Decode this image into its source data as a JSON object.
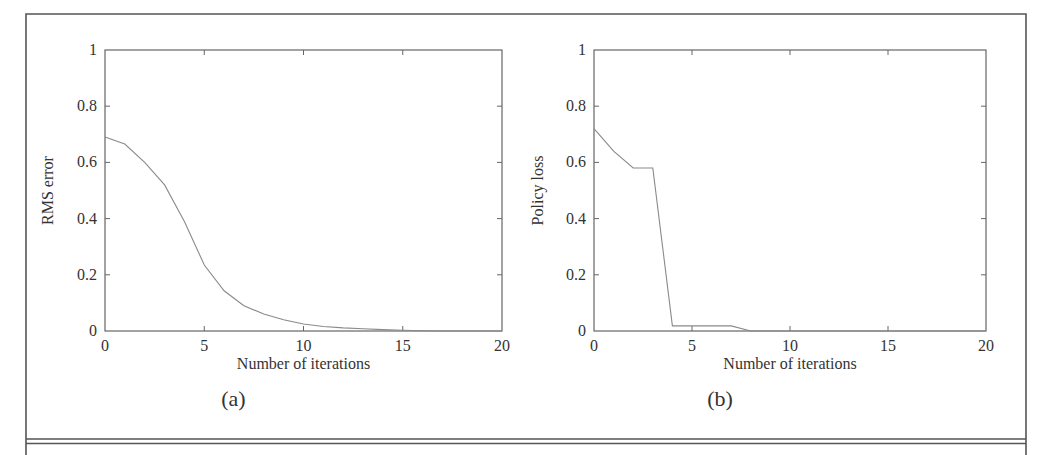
{
  "figure": {
    "panels": [
      "(a)",
      "(b)"
    ]
  },
  "chart_data": [
    {
      "type": "line",
      "panel_label": "(a)",
      "title": "",
      "xlabel": "Number of iterations",
      "ylabel": "RMS error",
      "xlim": [
        0,
        20
      ],
      "ylim": [
        0,
        1
      ],
      "xticks": [
        0,
        5,
        10,
        15,
        20
      ],
      "xtick_labels": [
        "0",
        "5",
        "10",
        "15",
        "20"
      ],
      "yticks": [
        0,
        0.2,
        0.4,
        0.6,
        0.8,
        1
      ],
      "ytick_labels": [
        "0",
        "0.2",
        "0.4",
        "0.6",
        "0.8",
        "1"
      ],
      "grid": false,
      "series": [
        {
          "name": "RMS error",
          "x": [
            0,
            1,
            2,
            3,
            4,
            5,
            6,
            7,
            8,
            9,
            10,
            11,
            12,
            13,
            14,
            15,
            16,
            17,
            18,
            19,
            20
          ],
          "y": [
            0.69,
            0.665,
            0.6,
            0.52,
            0.39,
            0.235,
            0.143,
            0.09,
            0.06,
            0.04,
            0.025,
            0.016,
            0.011,
            0.008,
            0.005,
            0.003,
            0.001,
            0.0,
            0.0,
            0.0,
            0.0
          ]
        }
      ]
    },
    {
      "type": "line",
      "panel_label": "(b)",
      "title": "",
      "xlabel": "Number of iterations",
      "ylabel": "Policy loss",
      "xlim": [
        0,
        20
      ],
      "ylim": [
        0,
        1
      ],
      "xticks": [
        0,
        5,
        10,
        15,
        20
      ],
      "xtick_labels": [
        "0",
        "5",
        "10",
        "15",
        "20"
      ],
      "yticks": [
        0,
        0.2,
        0.4,
        0.6,
        0.8,
        1
      ],
      "ytick_labels": [
        "0",
        "0.2",
        "0.4",
        "0.6",
        "0.8",
        "1"
      ],
      "grid": false,
      "series": [
        {
          "name": "Policy loss",
          "x": [
            0,
            1,
            2,
            3,
            4,
            5,
            6,
            7,
            8,
            9,
            10,
            11,
            12,
            13,
            14,
            15,
            16,
            17,
            18,
            19,
            20
          ],
          "y": [
            0.72,
            0.64,
            0.58,
            0.58,
            0.018,
            0.018,
            0.018,
            0.018,
            0.0,
            0.0,
            0.0,
            0.0,
            0.0,
            0.0,
            0.0,
            0.0,
            0.0,
            0.0,
            0.0,
            0.0,
            0.0
          ]
        }
      ]
    }
  ]
}
